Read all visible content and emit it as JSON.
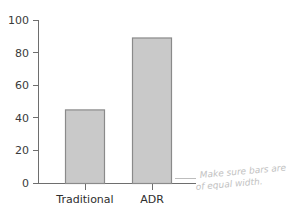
{
  "chart_data": {
    "type": "bar",
    "title": "",
    "subtitle": "",
    "xlabel": "",
    "ylabel": "",
    "categories": [
      "Traditional",
      "ADR"
    ],
    "values": [
      45,
      89
    ],
    "series": [
      {
        "name": "",
        "values": [
          45,
          89
        ]
      }
    ],
    "ylim": [
      0,
      100
    ],
    "yticks": [
      0,
      20,
      40,
      60,
      80,
      100
    ],
    "ytick_labels": [
      "0",
      "20",
      "40",
      "60",
      "80",
      "100"
    ],
    "grid": false,
    "legend": false,
    "legend_position": "none",
    "bar_fill_color": "#c9c9c9",
    "bar_border_color": "#8a8a8a",
    "axis_color": "#6e6e6e",
    "annotations": [
      {
        "name": "equal-width-note",
        "lines": [
          "Make sure bars are",
          "of equal width."
        ],
        "color": "#c2c2c2",
        "style": "italic",
        "has_leader_line": true
      }
    ]
  },
  "axis": {
    "y_labels": [
      "100",
      "80",
      "60",
      "40",
      "20",
      "0"
    ],
    "x_labels": [
      "Traditional",
      "ADR"
    ]
  },
  "annotation": {
    "line1": "Make sure bars are",
    "line2": "of equal width."
  }
}
